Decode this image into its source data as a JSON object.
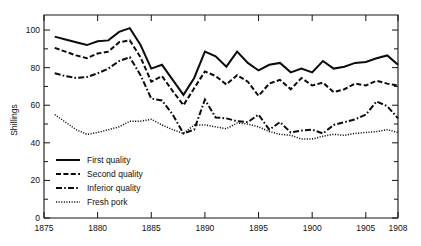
{
  "chart_data": {
    "type": "line",
    "title": "",
    "xlabel": "",
    "ylabel": "Shillings",
    "xlim": [
      1875,
      1908
    ],
    "ylim": [
      0,
      108
    ],
    "grid": false,
    "legend_position": "lower-left",
    "x_ticks": [
      "1875",
      "1880",
      "1885",
      "1890",
      "1895",
      "1900",
      "1905",
      "1908"
    ],
    "x_tick_values": [
      1875,
      1880,
      1885,
      1890,
      1895,
      1900,
      1905,
      1908
    ],
    "y_ticks": [
      "0",
      "20",
      "40",
      "60",
      "80",
      "100"
    ],
    "y_tick_values": [
      0,
      20,
      40,
      60,
      80,
      100
    ],
    "y_minor_tick_values": [
      10,
      30,
      50,
      70,
      90
    ],
    "x": [
      1876,
      1877,
      1878,
      1879,
      1880,
      1881,
      1882,
      1883,
      1884,
      1885,
      1886,
      1887,
      1888,
      1889,
      1890,
      1891,
      1892,
      1893,
      1894,
      1895,
      1896,
      1897,
      1898,
      1899,
      1900,
      1901,
      1902,
      1903,
      1904,
      1905,
      1906,
      1907,
      1908
    ],
    "series": [
      {
        "name": "First quality",
        "style": "solid",
        "values": [
          96.5,
          95.0,
          93.5,
          92.0,
          94.0,
          94.5,
          99.0,
          101.0,
          92.0,
          79.5,
          81.5,
          73.5,
          65.5,
          74.5,
          88.5,
          86.0,
          80.5,
          88.5,
          82.5,
          78.5,
          81.5,
          82.5,
          77.5,
          79.5,
          77.5,
          83.5,
          79.5,
          80.5,
          82.5,
          83.0,
          85.0,
          86.5,
          81.5
        ]
      },
      {
        "name": "Second quality",
        "style": "dashed",
        "values": [
          90.5,
          88.5,
          86.5,
          85.0,
          87.5,
          88.5,
          93.5,
          94.5,
          85.5,
          72.5,
          75.5,
          67.5,
          60.0,
          69.0,
          78.0,
          75.5,
          71.0,
          76.0,
          72.5,
          65.0,
          71.5,
          73.5,
          68.5,
          74.5,
          70.5,
          72.0,
          67.0,
          68.5,
          71.5,
          70.5,
          73.0,
          71.5,
          70.5
        ]
      },
      {
        "name": "Inferior quality",
        "style": "dashdot",
        "values": [
          77.0,
          75.5,
          74.5,
          75.0,
          77.0,
          79.5,
          83.5,
          85.5,
          76.0,
          63.5,
          62.5,
          55.0,
          45.0,
          47.0,
          63.0,
          53.5,
          53.0,
          51.5,
          51.0,
          55.0,
          47.0,
          51.0,
          45.5,
          46.5,
          47.0,
          45.0,
          49.5,
          51.0,
          52.5,
          55.0,
          62.0,
          59.5,
          53.0
        ]
      },
      {
        "name": "Fresh pork",
        "style": "dotted",
        "values": [
          55.0,
          51.0,
          47.0,
          44.5,
          45.5,
          47.0,
          48.5,
          51.5,
          51.5,
          52.5,
          49.5,
          47.0,
          45.0,
          49.5,
          49.5,
          48.5,
          47.5,
          50.5,
          50.0,
          48.5,
          46.0,
          44.5,
          44.0,
          42.0,
          42.0,
          43.5,
          44.5,
          44.0,
          45.0,
          45.5,
          46.0,
          47.0,
          45.5
        ]
      }
    ]
  },
  "legend": {
    "items": [
      {
        "label": "First quality",
        "style": "solid"
      },
      {
        "label": "Second quality",
        "style": "dashed"
      },
      {
        "label": "Inferior quality",
        "style": "dashdot"
      },
      {
        "label": "Fresh pork",
        "style": "dotted"
      }
    ]
  },
  "axes": {
    "y_title": "Shillings",
    "y_tick_labels": [
      "100",
      "80",
      "60",
      "40",
      "20",
      "0"
    ],
    "x_tick_labels": [
      "1875",
      "1880",
      "1885",
      "1890",
      "1895",
      "1900",
      "1905",
      "1908"
    ]
  },
  "colors": {
    "ink": "#0b0b0b",
    "background": "#ffffff"
  }
}
